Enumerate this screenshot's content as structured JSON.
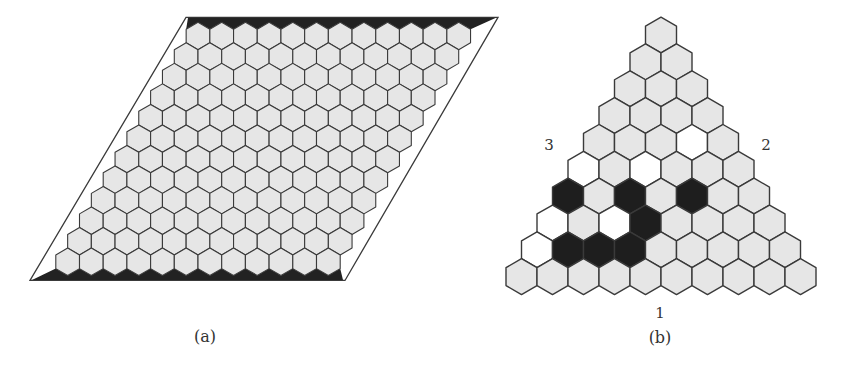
{
  "colors": {
    "background": "#ffffff",
    "cell_empty": "#e6e6e6",
    "cell_white": "#ffffff",
    "cell_black": "#1e1e1e",
    "stroke": "#3a3a3a",
    "edge_fill": "#222222"
  },
  "figure_a": {
    "caption": "(a)",
    "board_type": "hex-rhombus",
    "size": 12,
    "description": "12x12 empty Hex board; top and bottom edges shaded black",
    "rows": [
      "............",
      "............",
      "............",
      "............",
      "............",
      "............",
      "............",
      "............",
      "............",
      "............",
      "............",
      "............"
    ]
  },
  "figure_b": {
    "caption": "(b)",
    "board_type": "hex-triangle",
    "size": 10,
    "side_labels": {
      "bottom": "1",
      "right": "2",
      "left": "3"
    },
    "legend": {
      ".": "empty (gray)",
      "W": "white stone",
      "B": "black stone"
    },
    "rows": [
      ".",
      "..",
      "...",
      "....",
      "...W.",
      "W.W...",
      "B.B.B..",
      "W.WB....",
      "WBBB.....",
      ".........."
    ]
  }
}
